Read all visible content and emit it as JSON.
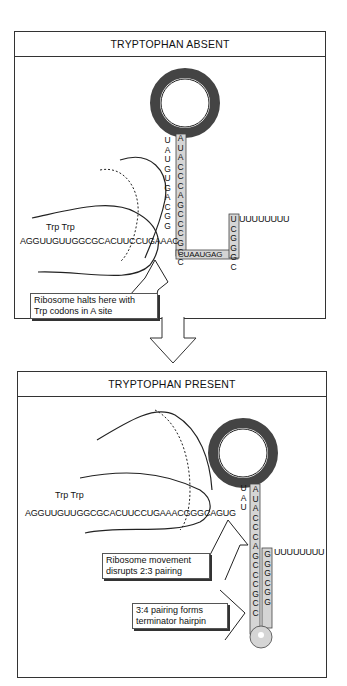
{
  "panels": [
    {
      "title": "TRYPTOPHAN ABSENT",
      "leader_sequence": "AGGUUGUUGGCGCACUUCCUGAAAC",
      "trp_labels": "Trp  Trp",
      "loop_sequence": "UCAGCCGCGUAAAGGCAAUCA",
      "stem_left": "UAUGUGACGG",
      "stem_right": "AUACCCAGCCCGCC",
      "bottom_sequence": "CUAAUGAG",
      "terminator_stem": "UCGGGC",
      "poly_u": "UUUUUUUU",
      "callout": [
        "Ribosome halts here with",
        "Trp codons in A site"
      ]
    },
    {
      "title": "TRYPTOPHAN PRESENT",
      "leader_sequence": "AGGUUGUUGGCGCACUUCCUGAAACGGGCAGUG",
      "trp_labels": "Trp  Trp",
      "loop_sequence": "UGACCACCGCGUAAAGGCAAUCAG",
      "stem_left": "UAU",
      "stem_right_outer": "AUACCCAGCCCGCC",
      "terminator_right": "GGGCGG",
      "terminator_loop": "UUAA",
      "poly_u": "UUUUUUUU",
      "callouts": [
        [
          "Ribosome movement",
          "disrupts 2:3 pairing"
        ],
        [
          "3:4 pairing forms",
          "terminator hairpin"
        ]
      ]
    }
  ],
  "colors": {
    "line": "#222222",
    "shade": "#cfcfcf",
    "loop": "#555555"
  }
}
